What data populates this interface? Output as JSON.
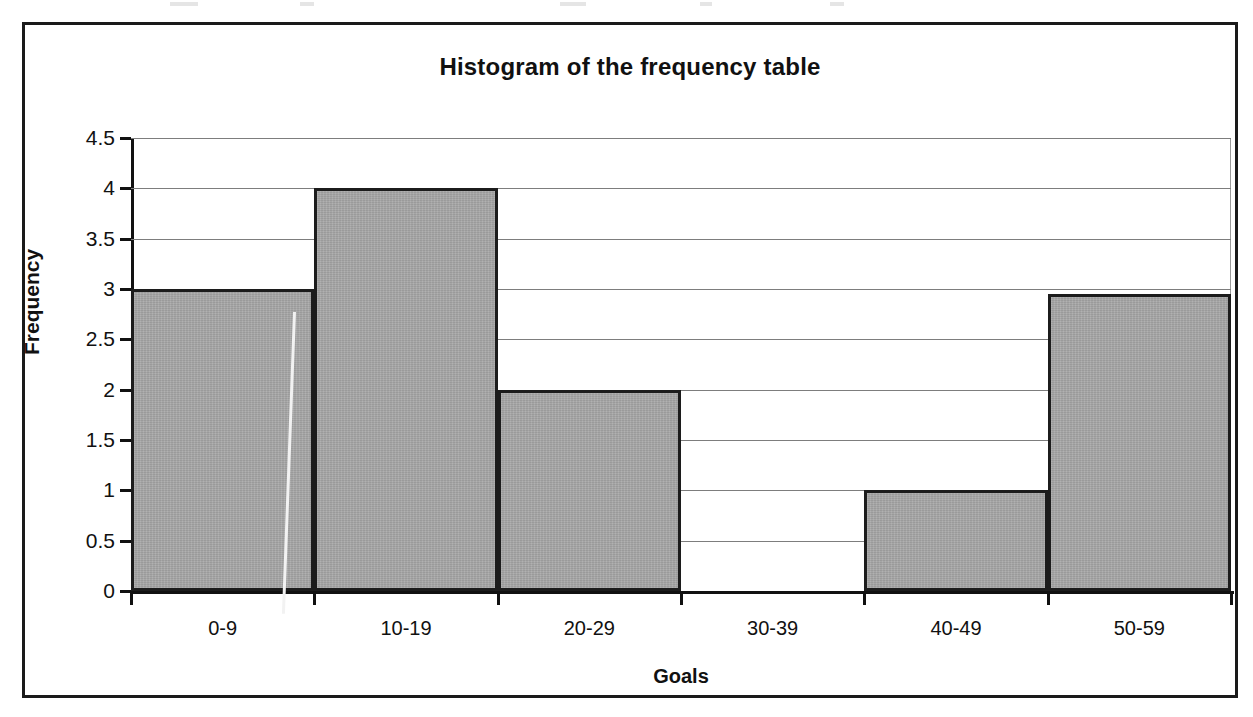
{
  "chart_data": {
    "type": "bar",
    "title": "Histogram of the frequency table",
    "xlabel": "Goals",
    "ylabel": "Frequency",
    "categories": [
      "0-9",
      "10-19",
      "20-29",
      "30-39",
      "40-49",
      "50-59"
    ],
    "values": [
      3,
      4,
      2,
      0,
      1,
      2.95
    ],
    "ylim": [
      0,
      4.5
    ],
    "yticks": [
      "0",
      "0.5",
      "1",
      "1.5",
      "2",
      "2.5",
      "3",
      "3.5",
      "4",
      "4.5"
    ],
    "ytick_values": [
      0,
      0.5,
      1,
      1.5,
      2,
      2.5,
      3,
      3.5,
      4,
      4.5
    ],
    "grid": true,
    "legend": false,
    "bar_fill_color": "#a8a8a8",
    "bar_edge_color": "#1c1c1c",
    "gridline_color": "#7d7d7d",
    "axis_color": "#111111",
    "background_color": "#ffffff"
  }
}
